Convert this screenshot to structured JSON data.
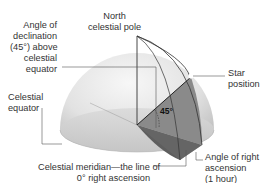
{
  "diagram": {
    "labels": {
      "north_pole": "North\ncelestial pole",
      "declination": "Angle of\ndeclination\n(45°) above\ncelestial\nequator",
      "star": "Star\nposition",
      "equator": "Celestial\nequator",
      "meridian": "Celestial meridian—the line of\n0° right ascension",
      "right_ascension": "Angle of right\nascension\n(1 hour)",
      "angle_value": "45°"
    },
    "colors": {
      "dome_light": "#f2f2f2",
      "dome_dark": "#c4c4c4",
      "base_plane": "#d3d3d3",
      "wedge_face": "#8a8a8a",
      "wedge_bottom": "#5e5e5e",
      "line": "#333333",
      "leader": "#555555"
    }
  }
}
